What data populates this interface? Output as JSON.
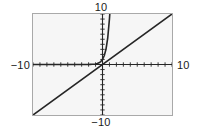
{
  "figure": {
    "name": "graph-of-exponential-and-identity",
    "background_color": "#ffffff",
    "plot_background_color": "#f6f6f6",
    "frame_color": "#a9a9a9",
    "curve_color": "#262626"
  },
  "labels": {
    "top": "10",
    "bottom": "−10",
    "left": "−10",
    "right": "10"
  },
  "chart_data": {
    "type": "line",
    "title": "",
    "xlabel": "",
    "ylabel": "",
    "xlim": [
      -10,
      10
    ],
    "ylim": [
      -10,
      10
    ],
    "grid": false,
    "legend": "none",
    "tick_labels": {
      "x": [
        "−10",
        "10"
      ],
      "y": [
        "−10",
        "10"
      ]
    },
    "x_tick_step": 1,
    "y_tick_step": 1,
    "axes_drawn": [
      "x-axis",
      "y-axis"
    ],
    "series": [
      {
        "name": "exponential",
        "expression": "y = e^(2.2x)",
        "style": "solid",
        "color": "#262626",
        "x": [
          -10,
          -9,
          -8,
          -7,
          -6,
          -5,
          -4.5,
          -4,
          -3.5,
          -3,
          -2.5,
          -2,
          -1.75,
          -1.5,
          -1.25,
          -1,
          -0.75,
          -0.5,
          -0.25,
          0,
          0.25,
          0.5,
          0.75,
          1,
          1.05
        ],
        "y": [
          0,
          0,
          0,
          0,
          0,
          0,
          0,
          0.0001,
          0.0005,
          0.0014,
          0.0041,
          0.0123,
          0.0213,
          0.0369,
          0.0639,
          0.1108,
          0.192,
          0.3329,
          0.5769,
          1,
          1.7333,
          3.0042,
          5.207,
          9.025,
          10.0
        ]
      },
      {
        "name": "identity",
        "expression": "y = x",
        "style": "solid",
        "color": "#262626",
        "x": [
          -10,
          10
        ],
        "y": [
          -10,
          10
        ]
      }
    ]
  }
}
